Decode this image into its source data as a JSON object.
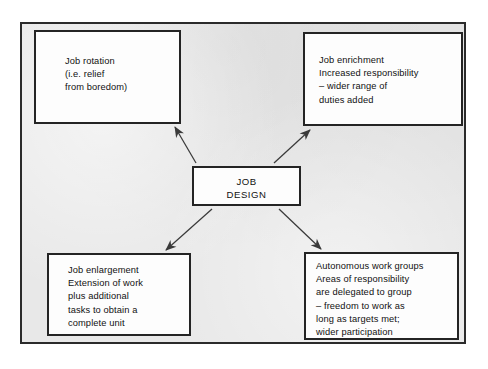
{
  "diagram": {
    "type": "radial-concept-map",
    "center": {
      "id": "job-design",
      "label": "JOB\nDESIGN"
    },
    "nodes": [
      {
        "id": "job-rotation",
        "position": "top-left",
        "label": "Job rotation\n(i.e. relief\nfrom boredom)"
      },
      {
        "id": "job-enrichment",
        "position": "top-right",
        "label": "Job enrichment\nIncreased responsibility\n  – wider range of\n  duties added"
      },
      {
        "id": "job-enlargement",
        "position": "bottom-left",
        "label": "Job enlargement\nExtension of work\n  plus additional\n  tasks to obtain a\n  complete unit"
      },
      {
        "id": "autonomous-work-groups",
        "position": "bottom-right",
        "label": "Autonomous work groups\nAreas of responsibility\n  are delegated to group\n  – freedom to work as\n  long as targets met;\n  wider participation"
      }
    ],
    "connectors": [
      {
        "id": "arrow-center-to-job-rotation",
        "from": "job-design",
        "to": "job-rotation",
        "style": "single-arrow"
      },
      {
        "id": "arrow-center-to-job-enrichment",
        "from": "job-design",
        "to": "job-enrichment",
        "style": "single-arrow"
      },
      {
        "id": "arrow-center-to-job-enlargement",
        "from": "job-design",
        "to": "job-enlargement",
        "style": "single-arrow"
      },
      {
        "id": "arrow-center-to-autonomous-work-groups",
        "from": "job-design",
        "to": "autonomous-work-groups",
        "style": "single-arrow"
      }
    ],
    "colors": {
      "page_background": "#e8e8e8",
      "frame_border": "#2b2b2b",
      "node_fill": "#fdfdfd",
      "node_border": "#242424",
      "text": "#111111",
      "connector": "#3a3a3a"
    }
  }
}
